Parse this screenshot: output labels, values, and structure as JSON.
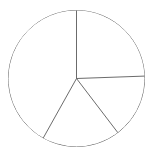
{
  "chart_data": {
    "type": "pie",
    "title": "",
    "subtitle": "",
    "xlabel": "",
    "ylabel": "",
    "legend": [],
    "legend_position": "none",
    "grid": false,
    "labels": [
      "Slice 1",
      "Slice 2",
      "Slice 3",
      "Slice 4"
    ],
    "values": [
      25.6,
      39.1,
      18.5,
      16.9
    ],
    "slice_angles_deg": [
      92.0,
      140.7,
      66.5,
      60.8
    ],
    "start_angle_deg": 90,
    "direction": "clockwise",
    "colors": [
      "#ffffff",
      "#ffffff",
      "#ffffff",
      "#ffffff"
    ],
    "edge_color": "#5a5a5a",
    "background_color": "#ffffff",
    "show_labels": false,
    "show_percentages": false,
    "radius_px": 68,
    "center_px": [
      76.5,
      78.5
    ]
  },
  "geometry": {
    "circle": {
      "cx": 76.5,
      "cy": 78.5,
      "r": 68
    },
    "spokes": [
      {
        "name": "spoke-top",
        "x1": 76.5,
        "y1": 78.5,
        "x2": 76.5,
        "y2": 10.5
      },
      {
        "name": "spoke-right",
        "x1": 76.5,
        "y1": 78.5,
        "x2": 144.4,
        "y2": 76.1
      },
      {
        "name": "spoke-bottom-right",
        "x1": 76.5,
        "y1": 78.5,
        "x2": 117.8,
        "y2": 132.6
      },
      {
        "name": "spoke-bottom-left",
        "x1": 76.5,
        "y1": 78.5,
        "x2": 43.3,
        "y2": 137.9
      }
    ]
  },
  "view": {
    "width": 153,
    "height": 153
  }
}
